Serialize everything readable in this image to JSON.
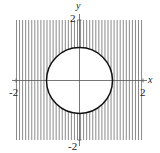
{
  "figure": {
    "axes": {
      "x_label": "x",
      "y_label": "y",
      "x_ticks": [
        {
          "value": -2,
          "label": "-2"
        },
        {
          "value": 2,
          "label": "2"
        }
      ],
      "y_ticks": [
        {
          "value": 2,
          "label": "2"
        },
        {
          "value": -2,
          "label": "-2"
        }
      ],
      "range": {
        "x": [
          -2,
          2
        ],
        "y": [
          -2,
          2
        ]
      }
    },
    "region": {
      "shading": "vertical-lines",
      "bounding_square": [
        -2,
        2,
        -2,
        2
      ],
      "excluded": {
        "shape": "circle",
        "center": [
          0,
          0
        ],
        "radius": 1
      }
    },
    "colors": {
      "stripe": "#8a8a8a",
      "circle": "#111111",
      "axis": "#555555",
      "background": "#ffffff"
    }
  }
}
